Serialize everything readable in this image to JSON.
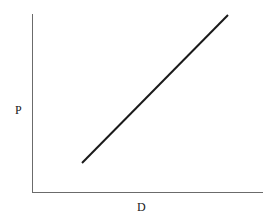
{
  "figure": {
    "background_color": "#ffffff",
    "width": 274,
    "height": 222
  },
  "chart_data": {
    "type": "line",
    "title": "",
    "subtitle": "",
    "xlabel": "D",
    "ylabel": "P",
    "grid": false,
    "legend": null,
    "legend_position": "none",
    "axis_color": "#6b6b6b",
    "series": [
      {
        "name": "demand-price-line",
        "color": "#1a1a1a",
        "line_width": 2,
        "x": [
          0.216,
          1.0
        ],
        "y": [
          0.163,
          0.994
        ],
        "points_px": [
          [
            82,
            163
          ],
          [
            228,
            15
          ]
        ],
        "slope_description": "upward sloping straight line"
      }
    ],
    "xlim": [
      0,
      1
    ],
    "ylim": [
      0,
      1
    ],
    "x_ticks": [],
    "y_ticks": [],
    "x_tick_labels": [],
    "y_tick_labels": [],
    "annotations": []
  },
  "axes": {
    "y_axis": {
      "name": "vertical-axis",
      "x_px": 32,
      "top_px": 14,
      "bottom_px": 192,
      "color": "#6b6b6b",
      "width": 1
    },
    "x_axis": {
      "name": "horizontal-axis",
      "y_px": 192,
      "left_px": 32,
      "right_px": 263,
      "color": "#6b6b6b",
      "width": 1
    }
  },
  "labels": {
    "y_axis_label": "P",
    "x_axis_label": "D"
  }
}
